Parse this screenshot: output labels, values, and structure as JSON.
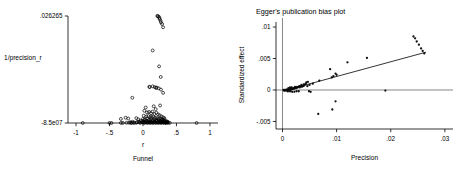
{
  "figure": {
    "background": "#ffffff",
    "marker_color": "#111111",
    "axis_color": "#000000"
  },
  "chart_data": [
    {
      "id": "funnel",
      "type": "scatter",
      "title": "",
      "subtitle": "Funnel",
      "xlabel": "r",
      "ylabel": "1/precision_r",
      "ylabel_rotated": false,
      "grid": false,
      "legend": "none",
      "xlim": [
        -1.12,
        1.12
      ],
      "ylim": [
        -8.5e-07,
        0.026265
      ],
      "xticks": [
        -1,
        -0.5,
        0,
        0.5,
        1
      ],
      "xticklabels": [
        "-1",
        "-.5",
        "0",
        ".5",
        "1"
      ],
      "yticks": [
        -8.5e-07,
        0.026265
      ],
      "yticklabels": [
        "-8.5e07",
        ".026265"
      ],
      "points": [
        [
          0.22,
          0.0262
        ],
        [
          0.235,
          0.0261
        ],
        [
          0.245,
          0.0258
        ],
        [
          0.25,
          0.0255
        ],
        [
          0.262,
          0.0251
        ],
        [
          0.268,
          0.0247
        ],
        [
          0.285,
          0.0243
        ],
        [
          0.3,
          0.0235
        ],
        [
          0.215,
          0.0263
        ],
        [
          0.145,
          0.0178
        ],
        [
          0.24,
          0.0139
        ],
        [
          0.265,
          0.0113
        ],
        [
          0.1,
          0.0088
        ],
        [
          0.145,
          0.009
        ],
        [
          0.175,
          0.0088
        ],
        [
          0.195,
          0.0086
        ],
        [
          0.205,
          0.0087
        ],
        [
          0.235,
          0.0085
        ],
        [
          0.268,
          0.0082
        ],
        [
          0.095,
          0.0089
        ],
        [
          -0.16,
          0.0062
        ],
        [
          0.3,
          0.0074
        ],
        [
          0.04,
          0.0038
        ],
        [
          0.16,
          0.0041
        ],
        [
          0.19,
          0.0034
        ],
        [
          -0.33,
          0.001
        ],
        [
          -0.26,
          0.0013
        ],
        [
          -0.22,
          0.0011
        ],
        [
          -0.1,
          0.0012
        ],
        [
          -0.07,
          0.0009
        ],
        [
          0.02,
          0.003
        ],
        [
          0.06,
          0.0026
        ],
        [
          0.09,
          0.0027
        ],
        [
          0.12,
          0.0024
        ],
        [
          0.14,
          0.0028
        ],
        [
          0.17,
          0.0022
        ],
        [
          0.2,
          0.0025
        ],
        [
          0.225,
          0.0021
        ],
        [
          0.25,
          0.0019
        ],
        [
          0.275,
          0.0016
        ],
        [
          0.3,
          0.0014
        ],
        [
          0.32,
          0.0012
        ],
        [
          0.01,
          0.0018
        ],
        [
          0.05,
          0.0016
        ],
        [
          0.08,
          0.0017
        ],
        [
          0.11,
          0.0015
        ],
        [
          0.13,
          0.0014
        ],
        [
          0.155,
          0.0016
        ],
        [
          0.18,
          0.0013
        ],
        [
          0.21,
          0.0012
        ],
        [
          0.235,
          0.0011
        ],
        [
          0.26,
          0.001
        ],
        [
          0.285,
          0.0009
        ],
        [
          0.31,
          0.0008
        ],
        [
          0.0,
          0.001
        ],
        [
          0.03,
          0.0009
        ],
        [
          0.06,
          0.0011
        ],
        [
          0.09,
          0.0008
        ],
        [
          0.12,
          0.001
        ],
        [
          0.15,
          0.0007
        ],
        [
          0.18,
          0.0009
        ],
        [
          0.205,
          0.0007
        ],
        [
          0.23,
          0.0008
        ],
        [
          0.255,
          0.0006
        ],
        [
          0.28,
          0.0007
        ],
        [
          0.305,
          0.0005
        ],
        [
          0.33,
          0.0006
        ],
        [
          0.355,
          0.0004
        ],
        [
          -0.04,
          0.0006
        ],
        [
          -0.01,
          0.0005
        ],
        [
          0.02,
          0.0007
        ],
        [
          0.05,
          0.0005
        ],
        [
          0.08,
          0.0006
        ],
        [
          0.11,
          0.0004
        ],
        [
          0.14,
          0.0005
        ],
        [
          0.17,
          0.0004
        ],
        [
          0.2,
          0.0005
        ],
        [
          0.23,
          0.0003
        ],
        [
          0.26,
          0.0004
        ],
        [
          0.29,
          0.0003
        ],
        [
          0.32,
          0.0004
        ],
        [
          0.345,
          0.0002
        ],
        [
          0.37,
          0.0003
        ],
        [
          -0.06,
          0.0003
        ],
        [
          -0.02,
          0.0002
        ],
        [
          0.01,
          0.0003
        ],
        [
          0.04,
          0.0002
        ],
        [
          0.07,
          0.0003
        ],
        [
          0.1,
          0.0002
        ],
        [
          0.13,
          0.0002
        ],
        [
          0.16,
          0.0003
        ],
        [
          0.19,
          0.0002
        ],
        [
          0.22,
          0.0002
        ],
        [
          0.25,
          0.0002
        ],
        [
          0.28,
          0.0002
        ],
        [
          0.31,
          0.0002
        ],
        [
          0.34,
          0.0001
        ],
        [
          0.36,
          0.0002
        ],
        [
          -0.19,
          0.0002
        ],
        [
          -0.155,
          0.0003
        ],
        [
          -0.13,
          0.0001
        ],
        [
          -0.09,
          0.0002
        ],
        [
          -0.05,
          0.0001
        ],
        [
          0.0,
          0.0001
        ],
        [
          0.03,
          0.0001
        ],
        [
          0.06,
          0.0001
        ],
        [
          0.09,
          0.0001
        ],
        [
          0.12,
          0.0001
        ],
        [
          0.15,
          0.0001
        ],
        [
          0.18,
          0.0001
        ],
        [
          0.21,
          0.0001
        ],
        [
          0.24,
          0.0001
        ],
        [
          0.27,
          0.0001
        ],
        [
          0.3,
          0.0001
        ],
        [
          0.33,
          0.0001
        ],
        [
          0.355,
          0.0001
        ],
        [
          -0.245,
          5e-05
        ],
        [
          -0.205,
          5e-05
        ],
        [
          -0.17,
          5e-05
        ],
        [
          -0.1,
          4e-05
        ],
        [
          -0.04,
          4e-05
        ],
        [
          0.02,
          4e-05
        ],
        [
          0.07,
          4e-05
        ],
        [
          0.11,
          4e-05
        ],
        [
          0.15,
          4e-05
        ],
        [
          0.19,
          4e-05
        ],
        [
          0.23,
          4e-05
        ],
        [
          0.27,
          4e-05
        ],
        [
          0.31,
          4e-05
        ],
        [
          0.345,
          4e-05
        ],
        [
          0.375,
          4e-05
        ],
        [
          -0.9,
          0.0
        ],
        [
          0.8,
          0.0
        ],
        [
          -0.5,
          0.0
        ],
        [
          -0.47,
          0.0
        ],
        [
          -0.33,
          2e-05
        ],
        [
          -0.3,
          2e-05
        ],
        [
          -0.175,
          2e-05
        ],
        [
          -0.14,
          2e-05
        ],
        [
          0.4,
          3e-05
        ],
        [
          0.255,
          0.0043
        ]
      ]
    },
    {
      "id": "egger",
      "type": "scatter",
      "title": "Egger's publication bias plot",
      "subtitle": "",
      "xlabel": "Precision",
      "ylabel": "Standardized effect",
      "ylabel_rotated": true,
      "grid": false,
      "legend": "none",
      "xlim": [
        -0.0012,
        0.0315
      ],
      "ylim": [
        -0.0062,
        0.0108
      ],
      "xticks": [
        0,
        0.01,
        0.02,
        0.03
      ],
      "xticklabels": [
        "0",
        ".01",
        ".02",
        ".03"
      ],
      "yticks": [
        -0.005,
        0,
        0.005,
        0.01
      ],
      "yticklabels": [
        "-.005",
        "0",
        ".005",
        ".01"
      ],
      "zero_line_y": 0,
      "vertical_line_x": 0,
      "regression_line": {
        "x0": 0.0002,
        "y0": -0.00015,
        "x1": 0.0265,
        "y1": 0.006
      },
      "points": [
        [
          0.0242,
          0.0085
        ],
        [
          0.0248,
          0.0077
        ],
        [
          0.0252,
          0.0072
        ],
        [
          0.0256,
          0.0066
        ],
        [
          0.0259,
          0.0062
        ],
        [
          0.0262,
          0.0058
        ],
        [
          0.0245,
          0.0082
        ],
        [
          0.0156,
          0.0051
        ],
        [
          0.012,
          0.0044
        ],
        [
          0.0088,
          0.0033
        ],
        [
          0.0098,
          0.0026
        ],
        [
          0.01,
          0.0024
        ],
        [
          0.0094,
          0.0022
        ],
        [
          0.0091,
          0.002
        ],
        [
          0.0068,
          0.0015
        ],
        [
          0.0056,
          0.001
        ],
        [
          0.005,
          0.0008
        ],
        [
          0.0047,
          0.0013
        ],
        [
          0.0044,
          0.0012
        ],
        [
          0.0042,
          0.0009
        ],
        [
          0.004,
          0.0007
        ],
        [
          0.0038,
          0.0006
        ],
        [
          0.0036,
          0.0005
        ],
        [
          0.0034,
          0.0006
        ],
        [
          0.0032,
          0.0004
        ],
        [
          0.003,
          0.0005
        ],
        [
          0.0028,
          0.0004
        ],
        [
          0.0026,
          0.0003
        ],
        [
          0.0024,
          0.0003
        ],
        [
          0.0022,
          0.0002
        ],
        [
          0.0021,
          0.0003
        ],
        [
          0.002,
          0.0002
        ],
        [
          0.0019,
          0.0002
        ],
        [
          0.0018,
          0.0002
        ],
        [
          0.0017,
          0.0001
        ],
        [
          0.0016,
          0.0002
        ],
        [
          0.0015,
          0.0001
        ],
        [
          0.0014,
          0.0001
        ],
        [
          0.0013,
          0.0001
        ],
        [
          0.0012,
          0.0001
        ],
        [
          0.0011,
          0.0001
        ],
        [
          0.001,
          0.0
        ],
        [
          0.0009,
          0.0001
        ],
        [
          0.0008,
          0.0
        ],
        [
          0.0007,
          0.0
        ],
        [
          0.0006,
          0.0
        ],
        [
          0.0005,
          -0.0001
        ],
        [
          0.0004,
          0.0
        ],
        [
          0.0003,
          -0.0001
        ],
        [
          0.0002,
          0.0
        ],
        [
          0.0009,
          -0.0002
        ],
        [
          0.0012,
          -0.0002
        ],
        [
          0.0015,
          -0.0002
        ],
        [
          0.0018,
          -0.0003
        ],
        [
          0.0022,
          -0.0003
        ],
        [
          0.0026,
          -0.0002
        ],
        [
          0.003,
          -0.0002
        ],
        [
          0.0011,
          0.0003
        ],
        [
          0.0014,
          0.0004
        ],
        [
          0.0017,
          0.0004
        ],
        [
          0.0023,
          0.0005
        ],
        [
          0.0027,
          0.0005
        ],
        [
          0.0031,
          0.0006
        ],
        [
          0.0035,
          0.0008
        ],
        [
          0.0039,
          0.0009
        ],
        [
          0.0043,
          0.001
        ],
        [
          0.0046,
          0.0006
        ],
        [
          0.0049,
          -0.0002
        ],
        [
          0.0052,
          -0.0003
        ],
        [
          0.0066,
          -0.0038
        ],
        [
          0.0092,
          -0.0031
        ],
        [
          0.0098,
          -0.0018
        ],
        [
          0.019,
          -0.0001
        ]
      ]
    }
  ]
}
